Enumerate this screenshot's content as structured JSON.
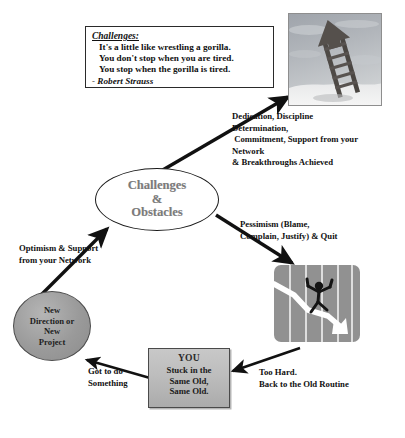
{
  "diagram": {
    "background_color": "#ffffff"
  },
  "quote_box": {
    "heading": "Challenges:",
    "lines": [
      "It's a little like wrestling a gorilla.",
      "You don't stop when you are tired.",
      "You stop when the gorilla is tired."
    ],
    "attribution": "- Robert Strauss"
  },
  "nodes": {
    "center": {
      "line1": "Challenges",
      "line2": "&",
      "line3": "Obstacles",
      "text_color": "#7b7b7b",
      "fill": "#ffffff"
    },
    "new_direction": {
      "line1": "New",
      "line2": "Direction or",
      "line3": "New",
      "line4": "Project",
      "fill": "#9a9a9a"
    },
    "you": {
      "title": "YOU",
      "line1": "Stuck in the",
      "line2": "Same Old,",
      "line3": "Same Old.",
      "fill": "#bdbdbd"
    }
  },
  "labels": {
    "success_path": "Dedication, Discipline\nDetermination,\n Commitment, Support from your\nNetwork\n& Breakthroughs Achieved",
    "failure_path": "Pessimism (Blame,\nComplain, Justify) & Quit",
    "optimism": "Optimism & Support\nfrom your Network",
    "got_to_do": "Got to do\nSomething",
    "too_hard": "Too Hard.\nBack to the Old Routine"
  },
  "images": {
    "ladder_photo": "ladder-to-sky-photo",
    "chart_photo": "falling-chart-stick-figure-photo"
  },
  "colors": {
    "line": "#111111",
    "node_gray": "#9a9a9a",
    "center_text": "#7b7b7b"
  }
}
